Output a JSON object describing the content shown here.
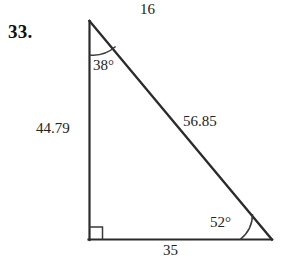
{
  "figure": {
    "problem_number": "33.",
    "shape": "right-triangle",
    "stroke_color": "#2b2b2b",
    "background_color": "#ffffff",
    "vertices": {
      "apex": {
        "x": 89,
        "y": 21
      },
      "bottom_left": {
        "x": 89,
        "y": 240
      },
      "bottom_right": {
        "x": 272,
        "y": 240
      }
    },
    "side_labels": {
      "top": "16",
      "left": "44.79",
      "hypotenuse": "56.85",
      "bottom": "35"
    },
    "angle_labels": {
      "apex": "38°",
      "bottom_right": "52°",
      "bottom_left": "right-angle-mark"
    },
    "right_angle_marker": {
      "size": 13,
      "visible": true
    },
    "arcs": {
      "apex_arc_radius": 34,
      "bottom_right_arc_radius": 32
    }
  },
  "icons": {
    "right_angle": "right-angle-icon",
    "arc_apex": "angle-arc-icon",
    "arc_bottom_right": "angle-arc-icon"
  }
}
